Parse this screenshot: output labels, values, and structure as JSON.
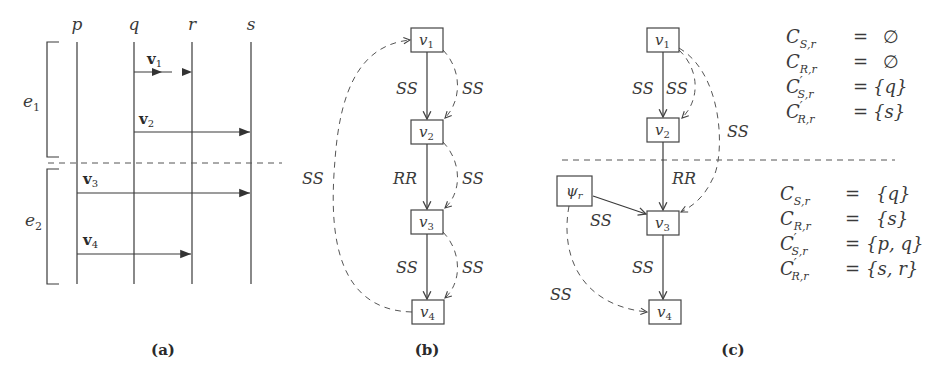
{
  "panel_a": {
    "processes": [
      "p",
      "q",
      "r",
      "s"
    ],
    "messages": [
      {
        "label": "v",
        "sub": "1",
        "from": "q",
        "to": "r"
      },
      {
        "label": "v",
        "sub": "2",
        "from": "q",
        "to": "s"
      },
      {
        "label": "v",
        "sub": "3",
        "from": "p",
        "to": "s"
      },
      {
        "label": "v",
        "sub": "4",
        "from": "p",
        "to": "r"
      }
    ],
    "epochs": [
      {
        "label": "e",
        "sub": "1"
      },
      {
        "label": "e",
        "sub": "2"
      }
    ],
    "caption": "(a)"
  },
  "panel_b": {
    "nodes": [
      {
        "label": "v",
        "sub": "1"
      },
      {
        "label": "v",
        "sub": "2"
      },
      {
        "label": "v",
        "sub": "3"
      },
      {
        "label": "v",
        "sub": "4"
      }
    ],
    "edge_labels": {
      "v1_v2_solid": "SS",
      "v1_v2_dashed": "SS",
      "v2_v3_solid": "RR",
      "v2_v3_dashed": "SS",
      "v3_v4_solid": "SS",
      "v3_v4_dashed": "SS",
      "v4_v1_dashed": "SS"
    },
    "caption": "(b)"
  },
  "panel_c": {
    "nodes": [
      {
        "label": "v",
        "sub": "1"
      },
      {
        "label": "v",
        "sub": "2"
      },
      {
        "label": "v",
        "sub": "3"
      },
      {
        "label": "v",
        "sub": "4"
      },
      {
        "label": "ψ",
        "sub": "r"
      }
    ],
    "edge_labels": {
      "v1_v2_solid": "SS",
      "v1_v2_dashed": "SS",
      "v1_v3_dashed": "SS",
      "v2_v3_solid": "RR",
      "psi_v3_solid": "SS",
      "v3_v4_solid": "SS",
      "psi_v4_dashed": "SS"
    },
    "sets_before": [
      {
        "name": "C",
        "prime": "",
        "sub": "S,r",
        "value": "∅"
      },
      {
        "name": "C",
        "prime": "",
        "sub": "R,r",
        "value": "∅"
      },
      {
        "name": "C",
        "prime": "′",
        "sub": "S,r",
        "value": "{q}"
      },
      {
        "name": "C",
        "prime": "′",
        "sub": "R,r",
        "value": "{s}"
      }
    ],
    "sets_after": [
      {
        "name": "C",
        "prime": "",
        "sub": "S,r",
        "value": "{q}"
      },
      {
        "name": "C",
        "prime": "",
        "sub": "R,r",
        "value": "{s}"
      },
      {
        "name": "C",
        "prime": "′",
        "sub": "S,r",
        "value": "{p, q}"
      },
      {
        "name": "C",
        "prime": "′",
        "sub": "R,r",
        "value": "{s, r}"
      }
    ],
    "equals": "=",
    "caption": "(c)"
  }
}
